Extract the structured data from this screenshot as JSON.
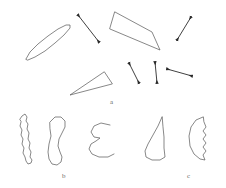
{
  "figure": {
    "width": 226,
    "height": 188,
    "background_color": "#ffffff",
    "stroke_color": "#555555",
    "arrow_color": "#2b2b2b",
    "label_color": "#6a6a6a",
    "stroke_width": 0.7
  },
  "panels": [
    {
      "id": "a",
      "label": "a",
      "label_position": {
        "x": 110,
        "y": 99
      },
      "description": "polygonal and elliptical outlines with double-headed orientation arrows"
    },
    {
      "id": "b",
      "label": "b",
      "label_position": {
        "x": 62,
        "y": 173
      },
      "description": "irregular closed and open contour outlines"
    },
    {
      "id": "c",
      "label": "c",
      "label_position": {
        "x": 187,
        "y": 173
      },
      "description": "fin-shaped and crescent outlines"
    }
  ],
  "shapes": [
    {
      "name": "elongated-ellipse",
      "panel": "a",
      "type": "closed-curve",
      "points": "26,59 30,52 38,44 48,36 58,29 66,25 70,25 70,28 64,35 55,43 45,51 35,57 28,60"
    },
    {
      "name": "thin-quadrilateral",
      "panel": "a",
      "type": "polygon",
      "points": "115,12 152,32 160,50 110,29"
    },
    {
      "name": "thin-triangle",
      "panel": "a",
      "type": "polygon",
      "points": "104,72 70,95 112,84"
    },
    {
      "name": "jagged-vertical-blob",
      "panel": "b",
      "type": "closed-curve",
      "points": "20,119 22,116 25,114 27,117 26,121 28,124 27,129 29,133 28,139 30,143 29,148 31,152 30,157 32,160 31,163 28,164 26,161 25,157 23,153 24,148 22,144 23,139 21,135 22,130 20,126 21,122"
    },
    {
      "name": "kidney-bean-outline",
      "panel": "b",
      "type": "closed-curve",
      "points": "50,122 55,117 61,117 65,121 65,127 62,133 59,139 58,146 60,152 62,157 61,162 57,165 52,164 49,159 48,152 49,144 51,136 50,129"
    },
    {
      "name": "open-hook-curve",
      "panel": "b",
      "type": "open-curve",
      "points": "110,125 101,123 94,126 91,132 94,137 100,138 96,141 91,144 89,149 92,154 99,157 108,157 114,154"
    },
    {
      "name": "fin-outline",
      "panel": "c",
      "type": "closed-curve",
      "points": "162,117 158,126 153,135 148,144 145,151 146,157 152,160 160,160 165,157 164,148 164,137 163,127"
    },
    {
      "name": "crescent-jagged-outline",
      "panel": "c",
      "type": "closed-curve",
      "points": "203,117 196,120 191,127 189,136 190,146 194,154 200,159 205,160 203,155 206,151 203,147 206,143 203,139 206,135 203,131 206,127 204,122"
    }
  ],
  "arrows": [
    {
      "name": "arrow-upper-left",
      "panel": "a",
      "type": "double-headed",
      "x1": 78,
      "y1": 15,
      "x2": 99,
      "y2": 42,
      "angle_deg": 52
    },
    {
      "name": "arrow-upper-right",
      "panel": "a",
      "type": "double-headed",
      "x1": 177,
      "y1": 40,
      "x2": 191,
      "y2": 17,
      "angle_deg": -59
    },
    {
      "name": "arrow-lower-left",
      "panel": "a",
      "type": "double-headed",
      "x1": 129,
      "y1": 63,
      "x2": 139,
      "y2": 83,
      "angle_deg": 63
    },
    {
      "name": "arrow-lower-middle",
      "panel": "a",
      "type": "double-headed",
      "x1": 155,
      "y1": 62,
      "x2": 157,
      "y2": 83,
      "angle_deg": 84
    },
    {
      "name": "arrow-lower-right",
      "panel": "a",
      "type": "double-headed",
      "x1": 167,
      "y1": 69,
      "x2": 192,
      "y2": 76,
      "angle_deg": 16
    }
  ]
}
